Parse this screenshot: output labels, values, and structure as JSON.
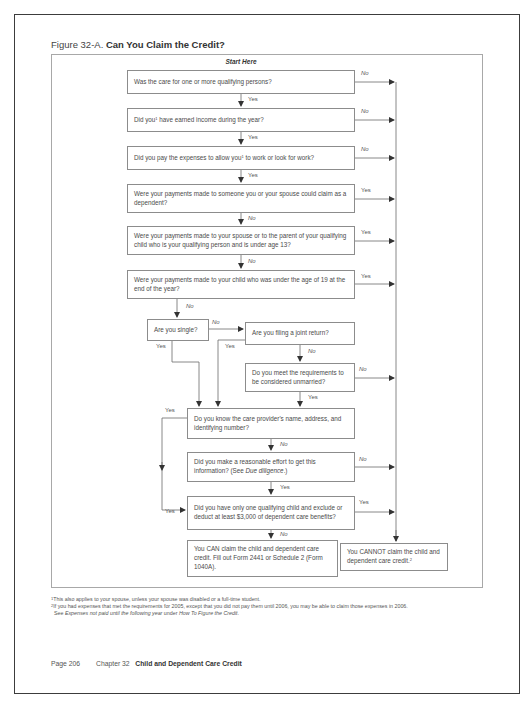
{
  "figure": {
    "label": "Figure 32-A.",
    "title": "Can You Claim the Credit?",
    "start": "Start Here"
  },
  "questions": {
    "q1": "Was the care for one or more qualifying persons?",
    "q2_pre": "Did you",
    "q2_sup": "1",
    "q2_post": " have earned income during the year?",
    "q3_pre": "Did you pay the expenses to allow you",
    "q3_sup": "1",
    "q3_post": " to work or look for work?",
    "q4": "Were your payments made to someone you or your spouse could claim as a dependent?",
    "q5": "Were your payments made to your spouse or to the parent of your qualifying child who is your qualifying person and is under age 13?",
    "q6": "Were your payments made to your child who was under the age of 19 at the end of the year?",
    "q7": "Are you single?",
    "q8": "Are you filing a joint return?",
    "q9": "Do you meet the requirements to be considered unmarried?",
    "q10": "Do you know the care provider's name, address, and identifying number?",
    "q11_pre": "Did you make a reasonable effort to get this information? (See ",
    "q11_em": "Due diligence",
    "q11_post": ".)",
    "q12": "Did you have only one qualifying child and exclude or deduct at least $3,000 of dependent care benefits?"
  },
  "outcomes": {
    "can": "You CAN claim the child and dependent care credit. Fill out Form 2441 or Schedule 2 (Form 1040A).",
    "cannot": "You CANNOT claim the child and dependent care credit.",
    "cannot_sup": "2"
  },
  "labels": {
    "yes": "Yes",
    "no": "No"
  },
  "footnotes": {
    "f1_sup": "1",
    "f1": "This also applies to your spouse, unless your spouse was disabled or a full-time student.",
    "f2_sup": "2",
    "f2": "If you had expenses that met the requirements for 2005, except that you did not pay them until 2006, you may be able to claim those expenses in 2006.",
    "f2b_pre": "See ",
    "f2b_em1": "Expenses not paid until the following year",
    "f2b_mid": " under ",
    "f2b_em2": "How To Figure the Credit",
    "f2b_post": "."
  },
  "footer": {
    "page": "Page 206",
    "chapter": "Chapter 32",
    "chapter_title": "Child and Dependent Care Credit"
  }
}
